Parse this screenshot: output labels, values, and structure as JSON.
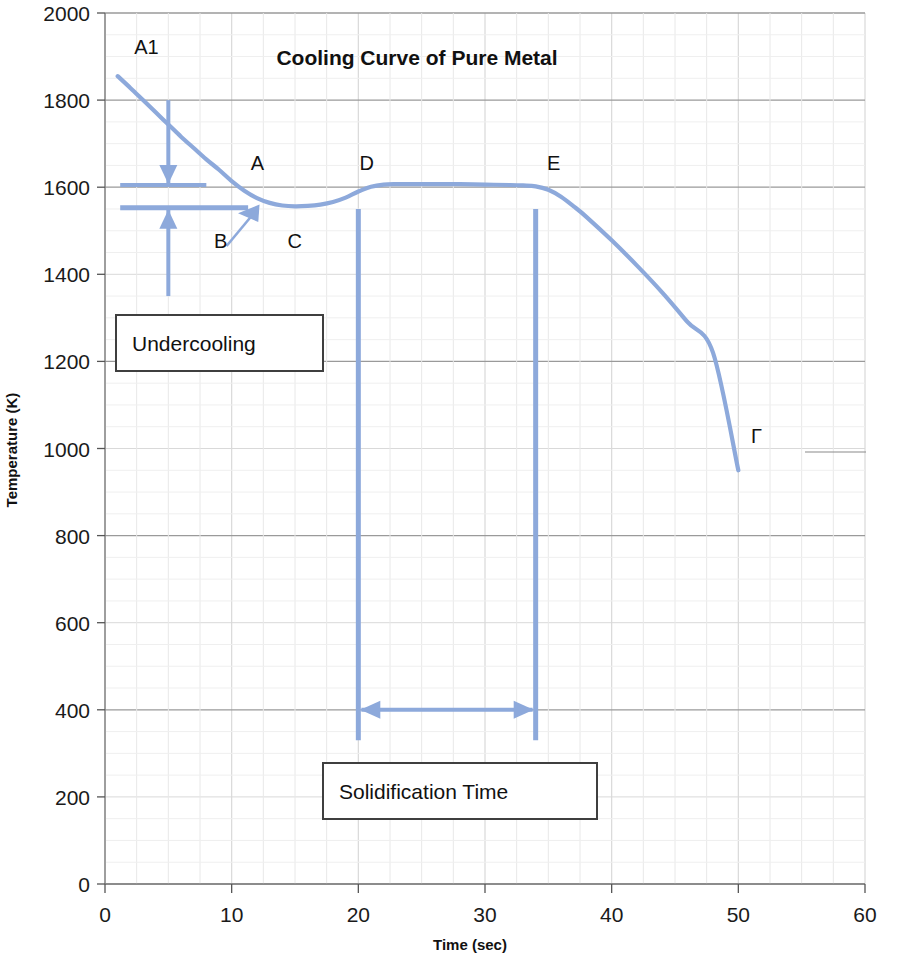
{
  "chart_data": {
    "type": "line",
    "title": "Cooling Curve of Pure Metal",
    "xlabel": "Time (sec)",
    "ylabel": "Temperature (K)",
    "xlim": [
      0,
      60
    ],
    "ylim": [
      0,
      2000
    ],
    "xticks": [
      "0",
      "10",
      "20",
      "30",
      "40",
      "50",
      "60"
    ],
    "yticks": [
      "0",
      "200",
      "400",
      "600",
      "800",
      "1000",
      "1200",
      "1400",
      "1600",
      "1800",
      "2000"
    ],
    "xtick_values": [
      0,
      10,
      20,
      30,
      40,
      50,
      60
    ],
    "ytick_values": [
      0,
      200,
      400,
      600,
      800,
      1000,
      1200,
      1400,
      1600,
      1800,
      2000
    ],
    "grid": true,
    "legend": "none",
    "series": [
      {
        "name": "Cooling curve",
        "color": "#8da9db",
        "x": [
          1.0,
          2.0,
          3.0,
          4.0,
          5.0,
          6.0,
          7.0,
          8.0,
          9.0,
          10.0,
          11.0,
          12.0,
          13.0,
          14.0,
          15.0,
          16.0,
          17.0,
          18.0,
          19.0,
          20.0,
          21.0,
          22.0,
          23.0,
          24.0,
          26.0,
          28.0,
          30.0,
          32.0,
          33.0,
          34.0,
          35.0,
          36.0,
          37.0,
          38.0,
          40.0,
          42.0,
          44.0,
          46.0,
          48.0,
          50.0
        ],
        "y": [
          1855,
          1828,
          1800,
          1772,
          1744,
          1716,
          1690,
          1664,
          1640,
          1614,
          1592,
          1575,
          1564,
          1558,
          1556,
          1557,
          1560,
          1566,
          1576,
          1590,
          1601,
          1606,
          1607,
          1607,
          1607,
          1607,
          1606,
          1605,
          1604,
          1602,
          1594,
          1578,
          1556,
          1532,
          1478,
          1420,
          1358,
          1290,
          1220,
          950
        ]
      }
    ],
    "annotations": {
      "points": [
        {
          "label": "A1",
          "x": 2.3,
          "y": 1905
        },
        {
          "label": "A",
          "x": 11.5,
          "y": 1640
        },
        {
          "label": "B",
          "x": 8.6,
          "y": 1460
        },
        {
          "label": "C",
          "x": 14.4,
          "y": 1460
        },
        {
          "label": "D",
          "x": 20.1,
          "y": 1640
        },
        {
          "label": "E",
          "x": 34.9,
          "y": 1640
        },
        {
          "label": "F",
          "x": 51.0,
          "y": 1013
        }
      ],
      "undercooling_label": "Undercooling",
      "solidification_label": "Solidification Time",
      "liquidus_level": 1605,
      "undercool_level": 1553,
      "solidification_start": 20.0,
      "solidification_end": 34.0,
      "arrow_color": "#8da9db"
    }
  },
  "colors": {
    "curve": "#8da9db",
    "arrow": "#8da9db",
    "grid": "#d9d9d9",
    "axis": "#7f7f7f",
    "text": "#111111",
    "background": "#ffffff"
  }
}
